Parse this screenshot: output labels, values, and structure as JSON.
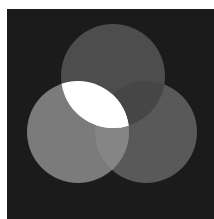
{
  "image": {
    "description": "Three overlapping gray circles on a dark background (Venn-like composition)",
    "background_color": "#1b1b1b",
    "border_color": "#ffffff",
    "circles": [
      {
        "name": "top",
        "color": "#4d4d4d"
      },
      {
        "name": "left",
        "color": "#7b7b7b"
      },
      {
        "name": "right",
        "color": "#595959"
      }
    ],
    "intersections": {
      "left_top": "#ffffff",
      "top_right": "#464646",
      "left_right": "#858585",
      "all_three": "#ffffff"
    }
  }
}
